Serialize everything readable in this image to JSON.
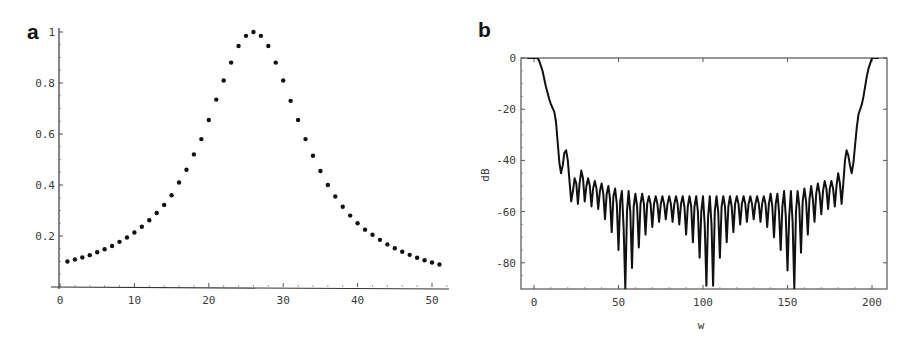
{
  "figure": {
    "panels": [
      {
        "label": "a"
      },
      {
        "label": "b"
      }
    ]
  },
  "chart_data": [
    {
      "panel": "a",
      "type": "scatter",
      "title": "",
      "xlabel": "",
      "ylabel": "",
      "xlim": [
        0,
        52
      ],
      "ylim": [
        0,
        1
      ],
      "xticks": [
        0,
        10,
        20,
        30,
        40,
        50
      ],
      "yticks": [
        0.2,
        0.4,
        0.6,
        0.8,
        1
      ],
      "ytick_labels": [
        "0.2",
        "0.4",
        "0.6",
        "0.8",
        "1"
      ],
      "grid": false,
      "x": [
        1,
        2,
        3,
        4,
        5,
        6,
        7,
        8,
        9,
        10,
        11,
        12,
        13,
        14,
        15,
        16,
        17,
        18,
        19,
        20,
        21,
        22,
        23,
        24,
        25,
        26,
        27,
        28,
        29,
        30,
        31,
        32,
        33,
        34,
        35,
        36,
        37,
        38,
        39,
        40,
        41,
        42,
        43,
        44,
        45,
        46,
        47,
        48,
        49,
        50,
        51
      ],
      "y": [
        0.1,
        0.108,
        0.116,
        0.125,
        0.136,
        0.148,
        0.161,
        0.177,
        0.194,
        0.214,
        0.236,
        0.262,
        0.29,
        0.322,
        0.36,
        0.41,
        0.46,
        0.52,
        0.58,
        0.655,
        0.735,
        0.81,
        0.88,
        0.945,
        0.985,
        1.0,
        0.985,
        0.945,
        0.88,
        0.81,
        0.73,
        0.655,
        0.58,
        0.515,
        0.455,
        0.4,
        0.355,
        0.315,
        0.28,
        0.25,
        0.225,
        0.205,
        0.185,
        0.167,
        0.152,
        0.138,
        0.126,
        0.115,
        0.105,
        0.096,
        0.088
      ]
    },
    {
      "panel": "b",
      "type": "line",
      "title": "",
      "xlabel": "w",
      "ylabel": "dB",
      "xlim": [
        -4,
        204
      ],
      "ylim": [
        -90,
        0
      ],
      "xticks": [
        0,
        50,
        100,
        150,
        200
      ],
      "yticks": [
        0,
        -20,
        -40,
        -60,
        -80
      ],
      "grid": false,
      "frame": true,
      "points": [
        [
          -4,
          0
        ],
        [
          2,
          0
        ],
        [
          3,
          -1
        ],
        [
          5,
          -5
        ],
        [
          7,
          -11
        ],
        [
          9,
          -16
        ],
        [
          10,
          -18
        ],
        [
          12,
          -21
        ],
        [
          13,
          -25
        ],
        [
          14,
          -33
        ],
        [
          15,
          -41
        ],
        [
          16,
          -45
        ],
        [
          17,
          -42
        ],
        [
          18,
          -37
        ],
        [
          19,
          -36
        ],
        [
          20,
          -40
        ],
        [
          21,
          -48
        ],
        [
          22,
          -56
        ],
        [
          23,
          -52
        ],
        [
          24,
          -47
        ],
        [
          25,
          -49
        ],
        [
          26,
          -57
        ],
        [
          27,
          -49
        ],
        [
          28,
          -44
        ],
        [
          29,
          -47
        ],
        [
          30,
          -56
        ],
        [
          31,
          -50
        ],
        [
          32,
          -47
        ],
        [
          33,
          -50
        ],
        [
          34,
          -58
        ],
        [
          35,
          -51
        ],
        [
          36,
          -48
        ],
        [
          37,
          -51
        ],
        [
          38,
          -59
        ],
        [
          39,
          -52
        ],
        [
          40,
          -49
        ],
        [
          41,
          -53
        ],
        [
          42,
          -63
        ],
        [
          43,
          -53
        ],
        [
          44,
          -50
        ],
        [
          45,
          -55
        ],
        [
          46,
          -68
        ],
        [
          47,
          -54
        ],
        [
          48,
          -51
        ],
        [
          49,
          -57
        ],
        [
          50,
          -75
        ],
        [
          51,
          -56
        ],
        [
          52,
          -52
        ],
        [
          53,
          -66
        ],
        [
          54,
          -90
        ],
        [
          55,
          -60
        ],
        [
          56,
          -52
        ],
        [
          57,
          -60
        ],
        [
          58,
          -82
        ],
        [
          59,
          -58
        ],
        [
          60,
          -53
        ],
        [
          61,
          -58
        ],
        [
          62,
          -74
        ],
        [
          63,
          -57
        ],
        [
          64,
          -53
        ],
        [
          65,
          -57
        ],
        [
          66,
          -69
        ],
        [
          67,
          -57
        ],
        [
          68,
          -54
        ],
        [
          69,
          -57
        ],
        [
          70,
          -66
        ],
        [
          71,
          -57
        ],
        [
          72,
          -54
        ],
        [
          73,
          -57
        ],
        [
          74,
          -64
        ],
        [
          75,
          -57
        ],
        [
          76,
          -54
        ],
        [
          77,
          -57
        ],
        [
          78,
          -63
        ],
        [
          79,
          -57
        ],
        [
          80,
          -54
        ],
        [
          81,
          -57
        ],
        [
          82,
          -64
        ],
        [
          83,
          -57
        ],
        [
          84,
          -54
        ],
        [
          85,
          -57
        ],
        [
          86,
          -65
        ],
        [
          87,
          -57
        ],
        [
          88,
          -54
        ],
        [
          89,
          -58
        ],
        [
          90,
          -69
        ],
        [
          91,
          -58
        ],
        [
          92,
          -54
        ],
        [
          93,
          -58
        ],
        [
          94,
          -72
        ],
        [
          95,
          -58
        ],
        [
          96,
          -54
        ],
        [
          97,
          -60
        ],
        [
          98,
          -78
        ],
        [
          99,
          -60
        ],
        [
          100,
          -54
        ],
        [
          101,
          -65
        ],
        [
          102,
          -89
        ],
        [
          103,
          -62
        ],
        [
          104,
          -54
        ],
        [
          105,
          -65
        ],
        [
          106,
          -89
        ],
        [
          107,
          -60
        ],
        [
          108,
          -54
        ],
        [
          109,
          -60
        ],
        [
          110,
          -78
        ],
        [
          111,
          -58
        ],
        [
          112,
          -54
        ],
        [
          113,
          -58
        ],
        [
          114,
          -72
        ],
        [
          115,
          -58
        ],
        [
          116,
          -54
        ],
        [
          117,
          -58
        ],
        [
          118,
          -68
        ],
        [
          119,
          -57
        ],
        [
          120,
          -54
        ],
        [
          121,
          -57
        ],
        [
          122,
          -65
        ],
        [
          123,
          -57
        ],
        [
          124,
          -54
        ],
        [
          125,
          -57
        ],
        [
          126,
          -64
        ],
        [
          127,
          -57
        ],
        [
          128,
          -54
        ],
        [
          129,
          -57
        ],
        [
          130,
          -63
        ],
        [
          131,
          -57
        ],
        [
          132,
          -54
        ],
        [
          133,
          -57
        ],
        [
          134,
          -64
        ],
        [
          135,
          -57
        ],
        [
          136,
          -54
        ],
        [
          137,
          -57
        ],
        [
          138,
          -66
        ],
        [
          139,
          -57
        ],
        [
          140,
          -53
        ],
        [
          141,
          -58
        ],
        [
          142,
          -70
        ],
        [
          143,
          -57
        ],
        [
          144,
          -53
        ],
        [
          145,
          -60
        ],
        [
          146,
          -75
        ],
        [
          147,
          -58
        ],
        [
          148,
          -52
        ],
        [
          149,
          -62
        ],
        [
          150,
          -83
        ],
        [
          151,
          -62
        ],
        [
          152,
          -52
        ],
        [
          153,
          -64
        ],
        [
          154,
          -90
        ],
        [
          155,
          -60
        ],
        [
          156,
          -52
        ],
        [
          157,
          -58
        ],
        [
          158,
          -76
        ],
        [
          159,
          -56
        ],
        [
          160,
          -51
        ],
        [
          161,
          -56
        ],
        [
          162,
          -69
        ],
        [
          163,
          -55
        ],
        [
          164,
          -50
        ],
        [
          165,
          -55
        ],
        [
          166,
          -64
        ],
        [
          167,
          -53
        ],
        [
          168,
          -49
        ],
        [
          169,
          -53
        ],
        [
          170,
          -61
        ],
        [
          171,
          -52
        ],
        [
          172,
          -48
        ],
        [
          173,
          -51
        ],
        [
          174,
          -59
        ],
        [
          175,
          -51
        ],
        [
          176,
          -48
        ],
        [
          177,
          -51
        ],
        [
          178,
          -58
        ],
        [
          179,
          -50
        ],
        [
          180,
          -45
        ],
        [
          181,
          -49
        ],
        [
          182,
          -57
        ],
        [
          183,
          -49
        ],
        [
          184,
          -40
        ],
        [
          185,
          -36
        ],
        [
          186,
          -38
        ],
        [
          187,
          -42
        ],
        [
          188,
          -45
        ],
        [
          189,
          -41
        ],
        [
          190,
          -34
        ],
        [
          191,
          -27
        ],
        [
          192,
          -22
        ],
        [
          193,
          -20
        ],
        [
          194,
          -18
        ],
        [
          195,
          -15
        ],
        [
          196,
          -11
        ],
        [
          197,
          -7
        ],
        [
          198,
          -4
        ],
        [
          199,
          -2
        ],
        [
          200,
          0
        ],
        [
          204,
          0
        ]
      ]
    }
  ]
}
